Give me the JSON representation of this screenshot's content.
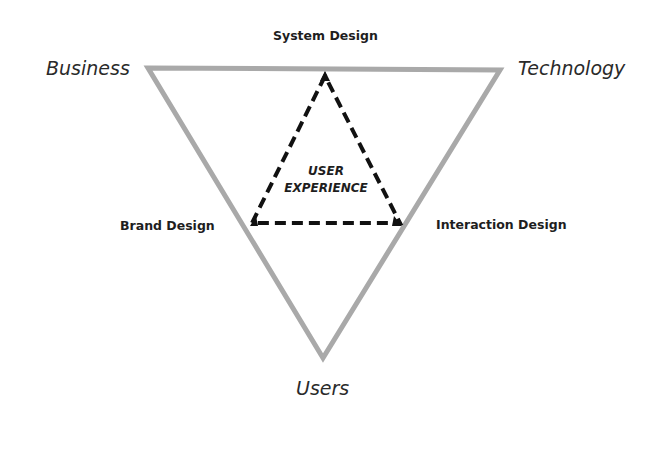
{
  "diagram": {
    "type": "nested-triangle",
    "center_label": {
      "line1": "USER",
      "line2": "EXPERIENCE"
    },
    "corner_labels": {
      "top_left": "Business",
      "top_right": "Technology",
      "bottom": "Users"
    },
    "side_labels": {
      "top": "System Design",
      "left": "Brand Design",
      "right": "Interaction Design"
    },
    "colors": {
      "outer_triangle": "#a9a9a9",
      "inner_triangle": "#111111",
      "text": "#1e1e1e",
      "background": "#ffffff"
    }
  }
}
